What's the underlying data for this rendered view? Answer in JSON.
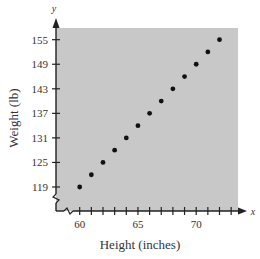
{
  "chart_data": {
    "type": "scatter",
    "title": "",
    "xlabel": "Height (inches)",
    "ylabel": "Weight (lb)",
    "x_axis_var": "x",
    "y_axis_var": "y",
    "xlim": [
      58.2,
      73.5
    ],
    "ylim": [
      111,
      158.5
    ],
    "x_ticks": [
      60,
      61,
      62,
      63,
      64,
      65,
      66,
      67,
      68,
      69,
      70,
      71,
      72,
      73
    ],
    "x_tick_labels": [
      "60",
      "65",
      "70"
    ],
    "y_ticks": [
      119,
      125,
      131,
      137,
      143,
      149,
      155
    ],
    "y_tick_labels": [
      "119",
      "125",
      "131",
      "137",
      "143",
      "149",
      "155"
    ],
    "axis_breaks": true,
    "grid": false,
    "legend": null,
    "background_color": "#c8c8c8",
    "point_color": "#111111",
    "series": [
      {
        "name": "Height vs Weight",
        "x": [
          60,
          61,
          62,
          63,
          64,
          65,
          66,
          67,
          68,
          69,
          70,
          71,
          72
        ],
        "y": [
          119,
          122,
          125,
          128,
          131,
          134,
          137,
          140,
          143,
          146,
          149,
          152,
          155
        ]
      }
    ]
  }
}
